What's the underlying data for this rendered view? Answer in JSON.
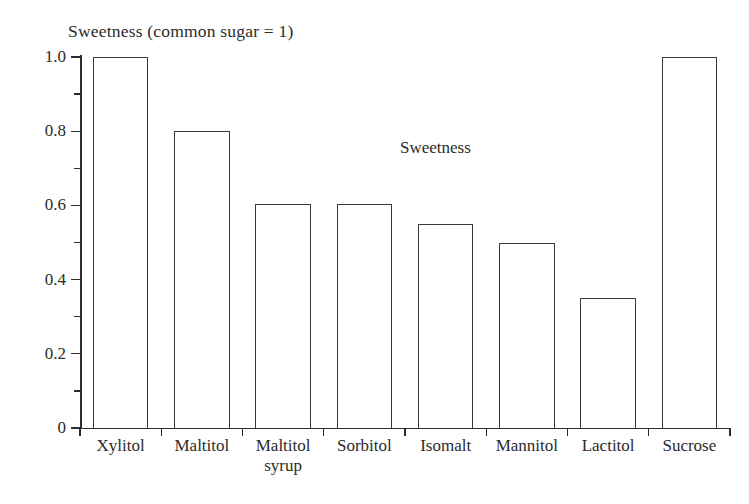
{
  "chart_data": {
    "type": "bar",
    "title": "Sweetness (common sugar = 1)",
    "annotation": "Sweetness",
    "xlabel": "",
    "ylabel": "",
    "ylim": [
      0,
      1.0
    ],
    "grid": false,
    "legend_position": "inside-plot",
    "categories": [
      "Xylitol",
      "Maltitol",
      "Maltitol syrup",
      "Sorbitol",
      "Isomalt",
      "Mannitol",
      "Lactitol",
      "Sucrose"
    ],
    "category_lines": [
      [
        "Xylitol",
        ""
      ],
      [
        "Maltitol",
        ""
      ],
      [
        "Maltitol",
        "syrup"
      ],
      [
        "Sorbitol",
        ""
      ],
      [
        "Isomalt",
        ""
      ],
      [
        "Mannitol",
        ""
      ],
      [
        "Lactitol",
        ""
      ],
      [
        "Sucrose",
        ""
      ]
    ],
    "values": [
      1.0,
      0.8,
      0.605,
      0.605,
      0.55,
      0.5,
      0.35,
      1.0
    ],
    "series": [
      {
        "name": "Sweetness",
        "values": [
          1.0,
          0.8,
          0.605,
          0.605,
          0.55,
          0.5,
          0.35,
          1.0
        ]
      }
    ],
    "y_major_ticks": [
      0,
      0.2,
      0.4,
      0.6,
      0.8,
      1.0
    ],
    "y_major_tick_labels": [
      "0",
      "0.2",
      "0.4",
      "0.6",
      "0.8",
      "1.0"
    ],
    "y_minor_ticks": [
      0.1,
      0.3,
      0.5,
      0.7,
      0.9
    ],
    "colors": {
      "bar_outline": "#3a3a3a",
      "bar_fill": "transparent",
      "axis": "#2d2d2d",
      "text": "#2b2b2b",
      "background": "#ffffff"
    }
  }
}
